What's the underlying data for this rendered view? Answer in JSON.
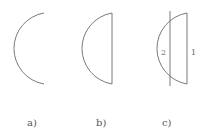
{
  "figures": [
    {
      "id": "a",
      "caption": "a)"
    },
    {
      "id": "b",
      "caption": "b)"
    },
    {
      "id": "c",
      "caption": "c)",
      "region_labels": [
        "2",
        "1"
      ]
    }
  ]
}
